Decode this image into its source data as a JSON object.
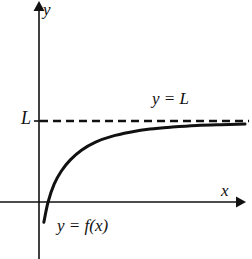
{
  "figure": {
    "labels": {
      "y_axis": "y",
      "x_axis": "x",
      "limit_value": "L",
      "asymptote": "y = L",
      "curve": "y = f(x)"
    },
    "colors": {
      "ink": "#111111",
      "background": "#ffffff"
    }
  },
  "chart_data": {
    "type": "line",
    "title": "",
    "xlabel": "x",
    "ylabel": "y",
    "grid": false,
    "legend": "none",
    "annotations": [
      {
        "name": "limit-tick-label",
        "text": "L",
        "x": 0,
        "y": 1.0
      },
      {
        "name": "asymptote-label",
        "text": "y = L",
        "x": 5.9,
        "y": 1.18
      },
      {
        "name": "curve-label",
        "text": "y = f(x)",
        "x": 1.0,
        "y": -0.35
      }
    ],
    "series": [
      {
        "name": "y = f(x)",
        "style": "solid",
        "x": [
          0.24,
          0.45,
          0.75,
          1.1,
          1.55,
          2.1,
          2.8,
          3.6,
          4.5,
          5.5,
          6.6,
          7.8,
          9.0,
          10.2
        ],
        "y": [
          -0.25,
          0.0,
          0.22,
          0.38,
          0.52,
          0.64,
          0.74,
          0.81,
          0.86,
          0.9,
          0.925,
          0.945,
          0.955,
          0.962
        ]
      },
      {
        "name": "y = L",
        "style": "dashed",
        "x": [
          0.0,
          10.4
        ],
        "y": [
          1.0,
          1.0
        ]
      }
    ],
    "xlim": [
      -1.95,
      10.6
    ],
    "ylim": [
      -2.8,
      2.5
    ],
    "asymptote": {
      "axis": "horizontal",
      "value": 1.0,
      "label": "y = L"
    },
    "x_intercept": 0.45
  }
}
